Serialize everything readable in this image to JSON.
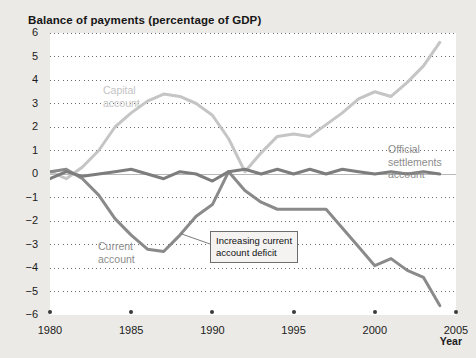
{
  "chart_data": {
    "type": "line",
    "title": "Balance of payments (percentage of GDP)",
    "xlabel": "Year",
    "ylabel": "",
    "xlim": [
      1980,
      2005
    ],
    "ylim": [
      -6,
      6
    ],
    "grid": true,
    "legend_position": "inline-annotations",
    "xticks": [
      "1980",
      "1985",
      "1990",
      "1995",
      "2000",
      "2005"
    ],
    "yticks": [
      "6",
      "5",
      "4",
      "3",
      "2",
      "1",
      "0",
      "−1",
      "−2",
      "−3",
      "−4",
      "−5",
      "−6"
    ],
    "x": [
      1980,
      1981,
      1982,
      1983,
      1984,
      1985,
      1986,
      1987,
      1988,
      1989,
      1990,
      1991,
      1992,
      1993,
      1994,
      1995,
      1996,
      1997,
      1998,
      1999,
      2000,
      2001,
      2002,
      2003,
      2004
    ],
    "series": [
      {
        "name": "Capital account",
        "color": "#c5c5c5",
        "values": [
          0.1,
          -0.2,
          0.3,
          1.0,
          2.0,
          2.6,
          3.1,
          3.4,
          3.3,
          3.0,
          2.5,
          1.5,
          0.1,
          0.9,
          1.6,
          1.7,
          1.6,
          2.1,
          2.6,
          3.2,
          3.5,
          3.3,
          3.9,
          4.6,
          5.6
        ]
      },
      {
        "name": "Current account",
        "color": "#8a8a8a",
        "values": [
          0.1,
          0.2,
          -0.2,
          -0.9,
          -1.9,
          -2.6,
          -3.2,
          -3.3,
          -2.6,
          -1.8,
          -1.3,
          0.1,
          -0.7,
          -1.2,
          -1.5,
          -1.5,
          -1.5,
          -1.5,
          -2.3,
          -3.1,
          -3.9,
          -3.6,
          -4.1,
          -4.4,
          -5.6
        ]
      },
      {
        "name": "Official settlements account",
        "color": "#7d7d7d",
        "values": [
          -0.2,
          0.1,
          -0.1,
          0.0,
          0.1,
          0.2,
          0.0,
          -0.2,
          0.1,
          0.0,
          -0.3,
          0.1,
          0.2,
          0.0,
          0.2,
          0.0,
          0.2,
          0.0,
          0.2,
          0.1,
          0.0,
          0.1,
          0.0,
          0.1,
          0.0
        ]
      }
    ],
    "annotations": [
      {
        "text_line1": "Increasing current",
        "text_line2": "account deficit",
        "points_to": "Current account"
      }
    ]
  },
  "labels": {
    "capital_line1": "Capital",
    "capital_line2": "account",
    "current_line1": "Current",
    "current_line2": "account",
    "official_line1": "Official",
    "official_line2": "settlements",
    "official_line3": "account"
  },
  "colors": {
    "page_background": "#eceae7",
    "plot_background": "#ffffff",
    "capital": "#c5c5c5",
    "current": "#8a8a8a",
    "official": "#7d7d7d",
    "grid": "#6f6f6f",
    "zero_line": "#b8b8b8",
    "text": "#1b1b1b"
  }
}
